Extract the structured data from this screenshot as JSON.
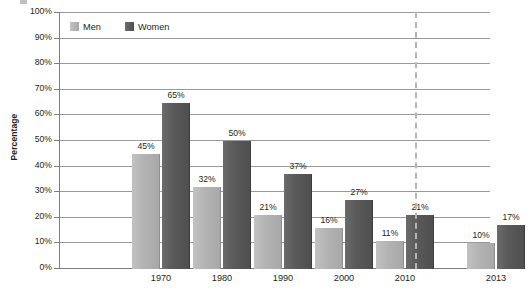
{
  "chart_data": {
    "type": "bar",
    "title": "",
    "xlabel": "",
    "ylabel": "Percentage",
    "ylim": [
      0,
      100
    ],
    "ytick_labels": [
      "100%",
      "90%",
      "80%",
      "70%",
      "60%",
      "50%",
      "40%",
      "30%",
      "20%",
      "10%",
      "0%"
    ],
    "ytick_values": [
      100,
      90,
      80,
      70,
      60,
      50,
      40,
      30,
      20,
      10,
      0
    ],
    "grid": true,
    "legend_position": "top-left",
    "categories": [
      "1970",
      "1980",
      "1990",
      "2000",
      "2010",
      "2013"
    ],
    "series": [
      {
        "name": "Men",
        "color": "#b4b4b4",
        "values": [
          45,
          32,
          21,
          16,
          11,
          10
        ],
        "labels": [
          "45%",
          "32%",
          "21%",
          "16%",
          "11%",
          "10%"
        ]
      },
      {
        "name": "Women",
        "color": "#585858",
        "values": [
          65,
          50,
          37,
          27,
          21,
          17
        ],
        "labels": [
          "65%",
          "50%",
          "37%",
          "27%",
          "21%",
          "17%"
        ]
      }
    ],
    "annotations": [
      {
        "kind": "vertical-dashed-separator",
        "after_category": "2010",
        "color": "#b5b5b5"
      }
    ]
  },
  "legend": {
    "items": [
      {
        "label": "Men",
        "swatch": "men-swatch"
      },
      {
        "label": "Women",
        "swatch": "women-swatch"
      }
    ]
  }
}
